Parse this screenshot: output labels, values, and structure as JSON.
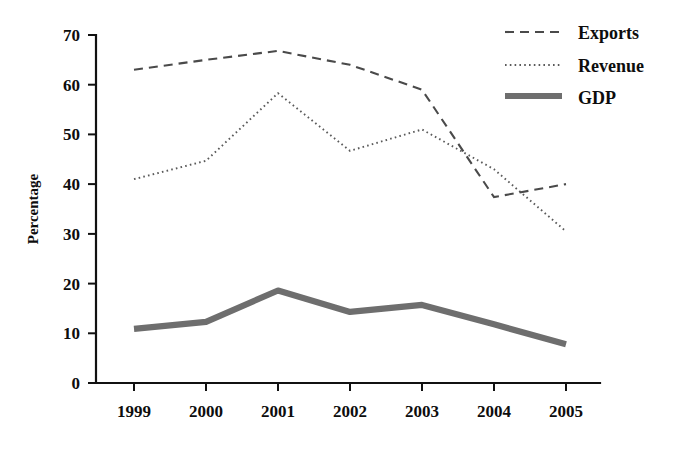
{
  "chart_data": {
    "type": "line",
    "title": "",
    "xlabel": "",
    "ylabel": "Percentage",
    "categories": [
      "1999",
      "2000",
      "2001",
      "2002",
      "2003",
      "2004",
      "2005"
    ],
    "x": [
      1999,
      2000,
      2001,
      2002,
      2003,
      2004,
      2005
    ],
    "ylim": [
      0,
      70
    ],
    "yticks": [
      0,
      10,
      20,
      30,
      40,
      50,
      60,
      70
    ],
    "grid": false,
    "legend_position": "top-right",
    "series": [
      {
        "name": "Exports",
        "style": "dashed",
        "color": "#4a4a4a",
        "values": [
          63,
          65,
          66.8,
          64,
          59,
          37.4,
          40
        ]
      },
      {
        "name": "Revenue",
        "style": "dotted",
        "color": "#5a5a5a",
        "values": [
          41,
          44.7,
          58.3,
          46.7,
          51,
          43,
          30.5
        ]
      },
      {
        "name": "GDP",
        "style": "thick-solid",
        "color": "#6e6e6e",
        "values": [
          10.9,
          12.3,
          18.6,
          14.3,
          15.7,
          11.8,
          7.8
        ]
      }
    ]
  },
  "axes": {
    "y_title": "Percentage",
    "y_tick_labels": [
      "70",
      "60",
      "50",
      "40",
      "30",
      "20",
      "10",
      "0"
    ],
    "x_tick_labels": [
      "1999",
      "2000",
      "2001",
      "2002",
      "2003",
      "2004",
      "2005"
    ]
  },
  "legend": {
    "entries": [
      {
        "label": "Exports"
      },
      {
        "label": "Revenue"
      },
      {
        "label": "GDP"
      }
    ]
  }
}
